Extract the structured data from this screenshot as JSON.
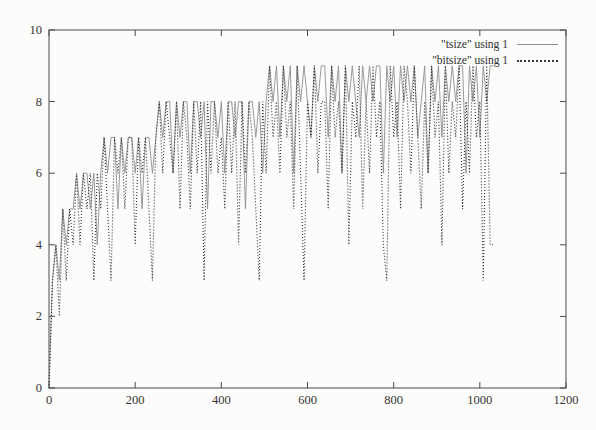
{
  "figure": {
    "background": "#fcfcfa",
    "border_color": "#4a4a4a",
    "tick_label_color": "#333333"
  },
  "chart_data": {
    "type": "line",
    "title": "",
    "xlabel": "",
    "ylabel": "",
    "xlim": [
      0,
      1200
    ],
    "ylim": [
      0,
      10
    ],
    "xticks": [
      0,
      200,
      400,
      600,
      800,
      1000,
      1200
    ],
    "yticks": [
      0,
      2,
      4,
      6,
      8,
      10
    ],
    "grid": false,
    "legend_position": "top-right-inside",
    "point_encoding": "y_digits is a string of single-digit y values; point i is (x_start + i*x_step, digit[i])",
    "x_start": 0,
    "x_step": 8,
    "series": [
      {
        "name": "tsize",
        "label": "\"tsize\" using 1",
        "style": "solid",
        "color": "#909090",
        "y_digits": "0343545565665646767757677675776787886878868878588786887885887868989798969898798997989698987989899698979898978969897989899698979899"
      },
      {
        "name": "bitsize",
        "label": "\"bitsize\" using 1",
        "style": "dotted",
        "color": "#2f2f2f",
        "y_digits": "0342535464656365753767577476753786876858758683868675868486875386978697859638796885978694879586978439785986975869784968795869783944"
      }
    ]
  },
  "legend": {
    "entries": [
      {
        "label": "\"tsize\" using 1",
        "style": "solid"
      },
      {
        "label": "\"bitsize\" using 1",
        "style": "dotted"
      }
    ]
  }
}
